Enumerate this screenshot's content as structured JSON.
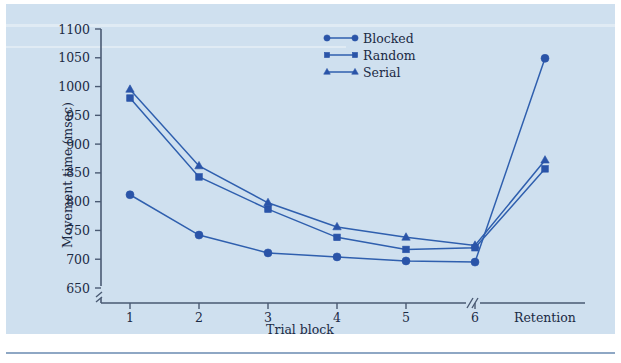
{
  "figure": {
    "background_color": "#cfe0ef",
    "ink_color": "#2a54a8",
    "axis_color": "#4a5a73"
  },
  "chart_data": {
    "type": "line",
    "title": "",
    "xlabel": "Trial block",
    "ylabel": "Movement time (msec)",
    "categories": [
      "1",
      "2",
      "3",
      "4",
      "5",
      "6",
      "Retention"
    ],
    "ylim": [
      650,
      1100
    ],
    "ytick_labels": [
      "650",
      "700",
      "750",
      "800",
      "850",
      "900",
      "950",
      "1000",
      "1050",
      "1100"
    ],
    "ytick_values": [
      650,
      700,
      750,
      800,
      850,
      900,
      950,
      1000,
      1050,
      1100
    ],
    "y_axis_break": true,
    "x_axis_break": true,
    "x_axis_break_label": "//",
    "grid": false,
    "legend_position": "top-center",
    "series": [
      {
        "name": "Blocked",
        "marker": "circle",
        "color": "#2a54a8",
        "values": [
          812,
          742,
          711,
          704,
          697,
          695,
          1049
        ]
      },
      {
        "name": "Random",
        "marker": "square",
        "color": "#2a54a8",
        "values": [
          980,
          843,
          787,
          738,
          717,
          720,
          857
        ]
      },
      {
        "name": "Serial",
        "marker": "triangle",
        "color": "#2a54a8",
        "values": [
          995,
          862,
          798,
          756,
          738,
          724,
          872
        ]
      }
    ]
  }
}
